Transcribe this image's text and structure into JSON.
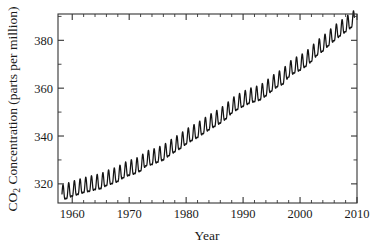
{
  "chart_data": {
    "type": "line",
    "title": "",
    "xlabel": "Year",
    "ylabel": "CO2 Concentration (parts per million)",
    "ylabel_main": "CO",
    "ylabel_sub": "2",
    "ylabel_rest": " Concentration (parts per million)",
    "xlim": [
      1957.5,
      2010.0
    ],
    "ylim": [
      312.0,
      391.0
    ],
    "grid": false,
    "legend": false,
    "legend_position": "none",
    "line_color": "#141414",
    "background_color": "#ffffff",
    "frame_color": "#333333",
    "xticks": [
      1960,
      1970,
      1980,
      1990,
      2000,
      2010
    ],
    "xtick_labels": [
      "1960",
      "1970",
      "1980",
      "1990",
      "2000",
      "2010"
    ],
    "xminor_step": 2,
    "yticks": [
      320,
      340,
      360,
      380
    ],
    "ytick_labels": [
      "320",
      "340",
      "360",
      "380"
    ],
    "yminor_step": 10,
    "seasonal_amplitude": 3.0,
    "series": [
      {
        "name": "Mauna Loa CO2 monthly mean",
        "x": [
          1958.2,
          1959.0,
          1960.0,
          1961.0,
          1962.0,
          1963.0,
          1964.0,
          1965.0,
          1966.0,
          1967.0,
          1968.0,
          1969.0,
          1970.0,
          1971.0,
          1972.0,
          1973.0,
          1974.0,
          1975.0,
          1976.0,
          1977.0,
          1978.0,
          1979.0,
          1980.0,
          1981.0,
          1982.0,
          1983.0,
          1984.0,
          1985.0,
          1986.0,
          1987.0,
          1988.0,
          1989.0,
          1990.0,
          1991.0,
          1992.0,
          1993.0,
          1994.0,
          1995.0,
          1996.0,
          1997.0,
          1998.0,
          1999.0,
          2000.0,
          2001.0,
          2002.0,
          2003.0,
          2004.0,
          2005.0,
          2006.0,
          2007.0,
          2008.0,
          2009.0
        ],
        "values": [
          315.3,
          315.9,
          316.9,
          317.6,
          318.4,
          318.9,
          319.6,
          320.0,
          321.3,
          322.1,
          323.0,
          324.6,
          325.6,
          326.3,
          327.4,
          329.6,
          330.1,
          331.1,
          332.0,
          333.8,
          335.4,
          336.8,
          338.7,
          340.1,
          341.4,
          343.0,
          344.6,
          346.0,
          347.4,
          349.2,
          351.6,
          353.1,
          354.4,
          355.6,
          356.4,
          357.1,
          358.8,
          360.8,
          362.6,
          363.7,
          366.7,
          368.4,
          369.5,
          371.1,
          373.2,
          375.8,
          377.5,
          379.8,
          381.9,
          383.8,
          385.6,
          387.4
        ]
      }
    ]
  },
  "axes": {
    "x_title": "Year",
    "y_title_prefix": "CO",
    "y_title_subscript": "2",
    "y_title_suffix": " Concentration (parts per million)"
  }
}
